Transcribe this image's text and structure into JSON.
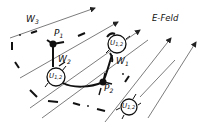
{
  "diagram": {
    "title_label": "E-Feld",
    "points": [
      {
        "id": "P1",
        "label": "P",
        "sub": "1"
      },
      {
        "id": "P2",
        "label": "P",
        "sub": "2"
      }
    ],
    "paths": [
      {
        "id": "W1",
        "label": "W",
        "sub": "1",
        "style": "solid-curve"
      },
      {
        "id": "W2",
        "label": "W",
        "sub": "2",
        "style": "solid-angled"
      },
      {
        "id": "W3",
        "label": "W",
        "sub": "3",
        "style": "dash-dot"
      }
    ],
    "meters": [
      {
        "id": "meter-top",
        "label": "U",
        "sub": "1,2"
      },
      {
        "id": "meter-left",
        "label": "U",
        "sub": "1,2"
      },
      {
        "id": "meter-bottom",
        "label": "U",
        "sub": "1,2"
      }
    ],
    "field_lines": 7,
    "colors": {
      "ink": "#111111",
      "field": "#444444",
      "background": "#ffffff"
    }
  }
}
